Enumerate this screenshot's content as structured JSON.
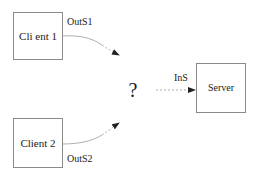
{
  "diagram": {
    "nodes": [
      {
        "id": "client1",
        "label": "Cli ent 1",
        "x": 13,
        "y": 12,
        "w": 49,
        "h": 47
      },
      {
        "id": "client2",
        "label": "Client 2",
        "x": 13,
        "y": 119,
        "w": 49,
        "h": 49
      },
      {
        "id": "server",
        "label": "Server",
        "x": 196,
        "y": 63,
        "w": 49,
        "h": 49
      }
    ],
    "unknown": {
      "label": "?"
    },
    "edges": [
      {
        "id": "outs1",
        "from": "client1",
        "to": "unknown",
        "label": "OutS1",
        "style": "solid-to-dashed curve"
      },
      {
        "id": "outs2",
        "from": "client2",
        "to": "unknown",
        "label": "OutS2",
        "style": "solid-to-dashed curve"
      },
      {
        "id": "ins",
        "from": "unknown",
        "to": "server",
        "label": "InS",
        "style": "dashed"
      }
    ],
    "colors": {
      "box_stroke": "#8a8a8a",
      "edge_stroke": "#9a9a9a",
      "arrowhead": "#222222",
      "text": "#1a1a1a"
    }
  }
}
